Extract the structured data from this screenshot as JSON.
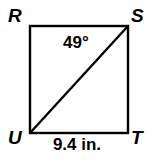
{
  "figure": {
    "type": "geometry-diagram",
    "shape": "square-with-diagonal",
    "vertices": [
      {
        "id": "R",
        "label": "R",
        "position": "top-left"
      },
      {
        "id": "S",
        "label": "S",
        "position": "top-right"
      },
      {
        "id": "T",
        "label": "T",
        "position": "bottom-right"
      },
      {
        "id": "U",
        "label": "U",
        "position": "bottom-left"
      }
    ],
    "diagonal": {
      "from": "U",
      "to": "S"
    },
    "angle": {
      "at_vertex": "S",
      "value": "49",
      "unit": "°",
      "text": "49°",
      "between": [
        "SR",
        "SU"
      ]
    },
    "side_length": {
      "on_side": "UT",
      "value": "9.4",
      "unit": "in.",
      "text": "9.4 in."
    },
    "colors": {
      "stroke": "#000000",
      "background": "#ffffff",
      "text": "#000000"
    },
    "geometry": {
      "left": 30,
      "top": 26,
      "right": 128,
      "bottom": 133,
      "stroke_width": 2.4
    }
  }
}
